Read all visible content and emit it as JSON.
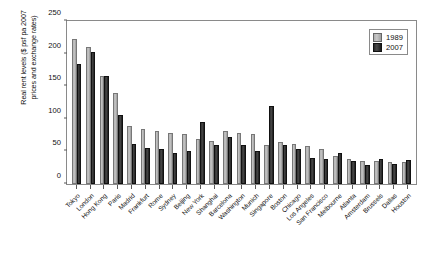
{
  "chart_data": {
    "type": "bar",
    "title": "",
    "xlabel": "",
    "ylabel": "Real rent levels ($ psf pa 2007\nprices and exchange rates)",
    "ylim": [
      0,
      250
    ],
    "yticks": [
      0,
      50,
      100,
      150,
      200,
      250
    ],
    "grid": false,
    "legend_position": "top-right",
    "categories": [
      "Tokyo",
      "London",
      "Hong Kong",
      "Paris",
      "Madrid",
      "Frankfurt",
      "Rome",
      "Sydney",
      "Beijing",
      "New York",
      "Shanghai",
      "Barcelona",
      "Washington",
      "Munich",
      "Singapore",
      "Boston",
      "Chicago",
      "Los Angeles",
      "San Francisco",
      "Melbourne",
      "Atlanta",
      "Amsterdam",
      "Brussels",
      "Dallas",
      "Houston"
    ],
    "series": [
      {
        "name": "1989",
        "color": "#b8b8b8",
        "values": [
          222,
          210,
          165,
          140,
          89,
          84,
          82,
          79,
          76,
          69,
          66,
          81,
          78,
          76,
          60,
          65,
          62,
          58,
          53,
          43,
          38,
          36,
          36,
          34,
          33
        ]
      },
      {
        "name": "2007",
        "color": "#262626",
        "values": [
          184,
          202,
          165,
          106,
          62,
          55,
          53,
          47,
          50,
          95,
          60,
          72,
          60,
          51,
          120,
          60,
          54,
          40,
          38,
          47,
          36,
          29,
          38,
          30,
          37
        ]
      }
    ]
  },
  "legend": {
    "items": [
      {
        "label": "1989",
        "series": "1989"
      },
      {
        "label": "2007",
        "series": "2007"
      }
    ]
  }
}
